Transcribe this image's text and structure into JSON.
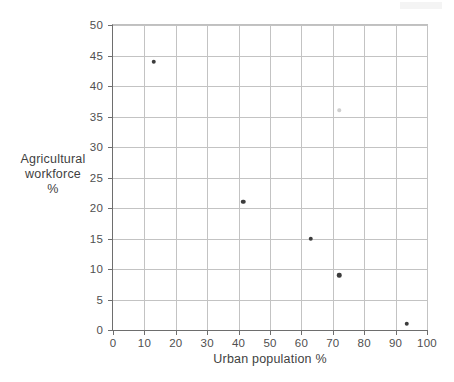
{
  "chart_data": {
    "type": "scatter",
    "title": "",
    "xlabel": "Urban population %",
    "ylabel_lines": [
      "Agricultural",
      "workforce",
      "%"
    ],
    "ylabel": "Agricultural workforce %",
    "xlim": [
      0,
      100
    ],
    "ylim": [
      0,
      50
    ],
    "xticks": [
      0,
      10,
      20,
      30,
      40,
      50,
      60,
      70,
      80,
      90,
      100
    ],
    "yticks": [
      0,
      5,
      10,
      15,
      20,
      25,
      30,
      35,
      40,
      45,
      50
    ],
    "xticklabels": [
      "0",
      "10",
      "20",
      "30",
      "40",
      "50",
      "60",
      "70",
      "80",
      "90",
      "100"
    ],
    "yticklabels": [
      "0",
      "5",
      "10",
      "15",
      "20",
      "25",
      "30",
      "35",
      "40",
      "45",
      "50"
    ],
    "grid": true,
    "legend": null,
    "marker_color": "#3c3c3c",
    "grid_color": "#c3c3c3",
    "axis_color": "#6e6e6e",
    "points": [
      {
        "x": 13,
        "y": 44,
        "faint": false
      },
      {
        "x": 41.5,
        "y": 21,
        "faint": false
      },
      {
        "x": 63,
        "y": 15,
        "faint": false
      },
      {
        "x": 72,
        "y": 36,
        "faint": true
      },
      {
        "x": 72,
        "y": 9,
        "faint": false
      },
      {
        "x": 93.5,
        "y": 1,
        "faint": false
      }
    ]
  }
}
